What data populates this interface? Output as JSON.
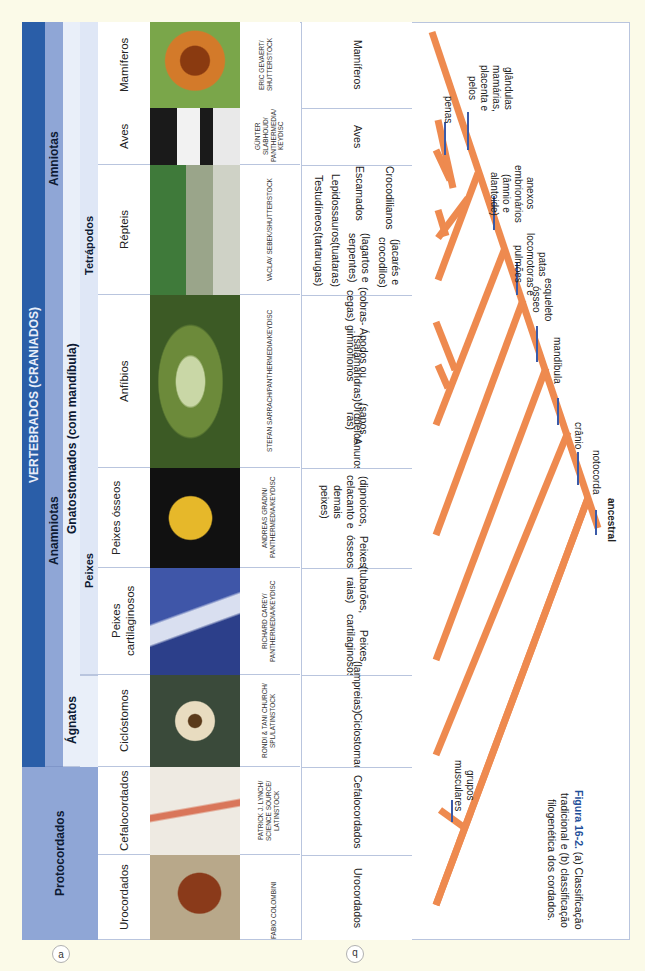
{
  "figure": {
    "badge_a": "a",
    "badge_b": "b",
    "caption_bold": "Figura 16-2.",
    "caption_text": "(a) Classificação tradicional e (b) classificação filogenética dos cordados."
  },
  "traditional": {
    "top_band": "VERTEBRADOS (CRANIADOS)",
    "protocordados": "Protocordados",
    "amniotas": "Amniotas",
    "anamniotas": "Anamniotas",
    "agnatos": "Ágnatos",
    "gnatostomados": "Gnatostomados (com mandíbula)",
    "peixes": "Peixes",
    "tetrapodos": "Tetrápodos",
    "groups": [
      {
        "name": "Mamíferos",
        "credit": "ERIC GEVAERT/ SHUTTERSTOCK",
        "photo_color": "#b8621f"
      },
      {
        "name": "Aves",
        "credit": "GÜNTER SLABHOUD/ PANTHERMEDIA/ KEYDISC",
        "photo_color": "#2a2a2a"
      },
      {
        "name": "Répteis",
        "credit": "VACLAV SEBEK/SHUTTERSTOCK",
        "photo_color": "#6f8a5a"
      },
      {
        "name": "Anfíbios",
        "credit": "STEFAN SARRACH/PANTHERMEDIA/KEYDISC",
        "photo_color": "#4f6b2a"
      },
      {
        "name": "Peixes ósseos",
        "credit": "ANDREAS GRADIN/ PANTHERMEDIA/KEYDISC",
        "photo_color": "#1a1a1a"
      },
      {
        "name": "Peixes cartilaginosos",
        "credit": "RICHARD CAREY/ PANTHERMEDIA/KEYDISC",
        "photo_color": "#2c3f8a"
      },
      {
        "name": "Ciclóstomos",
        "credit": "RONDI & TANI CHURCH/ SPL/LATINSTOCK",
        "photo_color": "#4a5a4a"
      },
      {
        "name": "Cefalocordados",
        "credit": "PATRICK J. LYNCH/ SCIENCE SOURCE/ LATINSTOCK",
        "photo_color": "#e8e4dc"
      },
      {
        "name": "Urocordados",
        "credit": "FABIO COLOMBINI",
        "photo_color": "#8a6a4a"
      }
    ]
  },
  "phylogenetic": {
    "clades": [
      {
        "name": "Mamíferos"
      },
      {
        "name": "Aves"
      },
      {
        "name": "Testudíneos (tartarugas) · Lepidossauros (tuataras) · Escamados (lagartos e serpentes) · Crocodilianos (jacarés e crocodilos)"
      },
      {
        "name": "Anuros (sapos, rãs) · Urodelos (salamandras) · Ápodos ou gimnofionos (cobras-cegas)"
      },
      {
        "name": "Peixes ósseos (dipnoicos, celacanto e demais peixes)"
      },
      {
        "name": "Peixes cartilaginosos (tubarões, raias)"
      },
      {
        "name": "Ciclostomados (lampreias)"
      },
      {
        "name": "Cefalocordados"
      },
      {
        "name": "Urocordados"
      }
    ],
    "reptile_subclades": [
      {
        "name": "Crocodilianos",
        "sub": "(jacarés e crocodilos)"
      },
      {
        "name": "Escamados",
        "sub": "(lagartos e serpentes)"
      },
      {
        "name": "Lepidossauros",
        "sub": "(tuataras)"
      },
      {
        "name": "Testudíneos",
        "sub": "(tartarugas)"
      }
    ],
    "amphibian_subclades": [
      {
        "name": "Ápodos ou gimnofionos",
        "sub": "(cobras-cegas)"
      },
      {
        "name": "Urodelos",
        "sub": "(salamandras)"
      },
      {
        "name": "Anuros",
        "sub": "(sapos, rãs)"
      }
    ],
    "single_clades": {
      "mamiferos": "Mamíferos",
      "aves": "Aves",
      "peixes_osseos": "Peixes ósseos",
      "peixes_osseos_sub": "(dipnoicos, celacanto e demais peixes)",
      "peixes_cart": "Peixes cartilaginosos",
      "peixes_cart_sub": "(tubarões, raias)",
      "ciclostomados": "Ciclostomados",
      "ciclostomados_sub": "(lampreias)",
      "cefalocordados": "Cefalocordados",
      "urocordados": "Urocordados"
    },
    "traits": {
      "ancestral": "ancestral",
      "notocorda": "notocorda",
      "cranio": "crânio",
      "mandibula": "mandíbula",
      "esqueleto": "esqueleto ósseo",
      "patas": "patas locomotoras e pulmões",
      "anexos": "anexos embrionários (âmnio e alantoide)",
      "penas": "penas",
      "glandulas": "glândulas mamárias, placenta e pelos",
      "grupos": "grupos musculares"
    },
    "colors": {
      "branch": "#ee8a4f",
      "trait_tick": "#3a5aa8"
    }
  }
}
